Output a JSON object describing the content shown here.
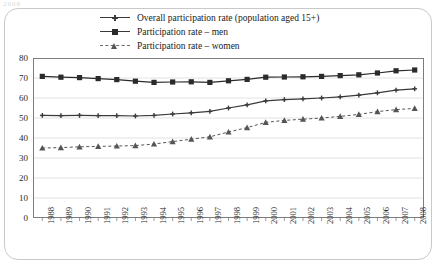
{
  "stub_text": "2008",
  "legend": {
    "items": [
      {
        "label": "Overall participation rate (population aged 15+)",
        "marker": "plus-marker",
        "line": "solid"
      },
      {
        "label": "Participation rate – men",
        "marker": "square-marker",
        "line": "solid"
      },
      {
        "label": "Participation rate – women",
        "marker": "triangle-marker",
        "line": "dashed"
      }
    ]
  },
  "chart_data": {
    "type": "line",
    "title": "",
    "xlabel": "",
    "ylabel": "",
    "ylim": [
      0,
      80
    ],
    "yticks": [
      0,
      10,
      20,
      30,
      40,
      50,
      60,
      70,
      80
    ],
    "grid": true,
    "legend_position": "top",
    "categories": [
      "1988",
      "1989",
      "1990",
      "1991",
      "1992",
      "1993",
      "1994",
      "1995",
      "1996",
      "1997",
      "1998",
      "1999",
      "2000",
      "2001",
      "2002",
      "2003",
      "2004",
      "2005",
      "2006",
      "2007",
      "2008"
    ],
    "series": [
      {
        "name": "Overall participation rate (population aged 15+)",
        "marker": "plus-marker",
        "line": "solid",
        "color": "#3a3a3a",
        "values": [
          51.3,
          51.2,
          51.3,
          51.2,
          51.2,
          51.0,
          51.3,
          52.0,
          52.6,
          53.3,
          55.0,
          56.6,
          58.6,
          59.2,
          59.6,
          60.0,
          60.6,
          61.4,
          62.6,
          63.9,
          64.6
        ]
      },
      {
        "name": "Participation rate – men",
        "marker": "square-marker",
        "line": "solid",
        "color": "#2b2b2b",
        "values": [
          70.8,
          70.4,
          70.2,
          69.7,
          69.2,
          68.4,
          67.8,
          68.0,
          68.1,
          67.8,
          68.6,
          69.3,
          70.4,
          70.5,
          70.6,
          70.8,
          71.2,
          71.6,
          72.5,
          73.6,
          74.0
        ]
      },
      {
        "name": "Participation rate – women",
        "marker": "triangle-marker",
        "line": "dashed",
        "color": "#555555",
        "values": [
          35.0,
          35.2,
          35.6,
          35.8,
          36.0,
          36.2,
          37.0,
          38.2,
          39.4,
          40.6,
          43.0,
          45.2,
          47.8,
          48.8,
          49.4,
          50.0,
          50.8,
          51.8,
          53.2,
          54.2,
          54.8
        ]
      }
    ]
  }
}
